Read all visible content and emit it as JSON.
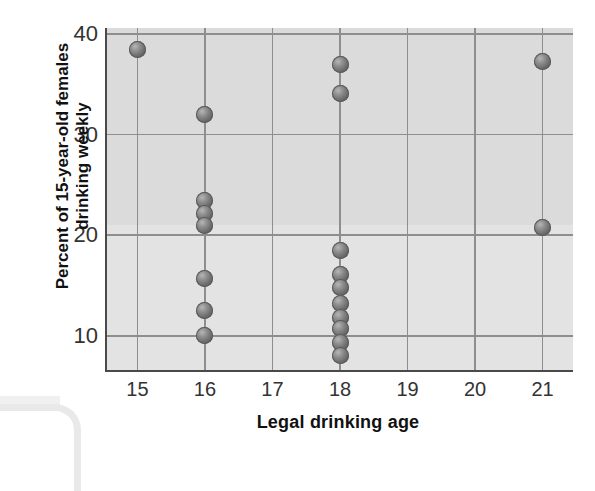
{
  "chart_data": {
    "type": "scatter",
    "title": "",
    "xlabel": "Legal drinking age",
    "ylabel": "Percent of 15-year-old females drinking weekly",
    "ylabel_line1": "Percent of 15-year-old females",
    "ylabel_line2": "drinking weekly",
    "xlim": [
      14.55,
      21.45
    ],
    "ylim": [
      6.6,
      40.6
    ],
    "xticks": [
      15,
      16,
      17,
      18,
      19,
      20,
      21
    ],
    "xtick_labels": [
      "15",
      "16",
      "17",
      "18",
      "19",
      "20",
      "21"
    ],
    "yticks": [
      10,
      20,
      30,
      40
    ],
    "ytick_labels": [
      "10",
      "20",
      "30",
      "40"
    ],
    "grid": "both",
    "legend": "none",
    "marker_color": "#6b6b6b",
    "plot_background": "#dbdbdb",
    "points": [
      {
        "x": 15,
        "y": 38.5
      },
      {
        "x": 16,
        "y": 32.0
      },
      {
        "x": 16,
        "y": 23.5
      },
      {
        "x": 16,
        "y": 22.2
      },
      {
        "x": 16,
        "y": 21.0
      },
      {
        "x": 16,
        "y": 15.7
      },
      {
        "x": 16,
        "y": 12.5
      },
      {
        "x": 16,
        "y": 10.0
      },
      {
        "x": 18,
        "y": 37.0
      },
      {
        "x": 18,
        "y": 34.1
      },
      {
        "x": 18,
        "y": 18.5
      },
      {
        "x": 18,
        "y": 16.1
      },
      {
        "x": 18,
        "y": 14.8
      },
      {
        "x": 18,
        "y": 13.2
      },
      {
        "x": 18,
        "y": 11.8
      },
      {
        "x": 18,
        "y": 10.7
      },
      {
        "x": 18,
        "y": 9.3
      },
      {
        "x": 18,
        "y": 8.0
      },
      {
        "x": 21,
        "y": 37.3
      },
      {
        "x": 21,
        "y": 20.8
      }
    ]
  }
}
